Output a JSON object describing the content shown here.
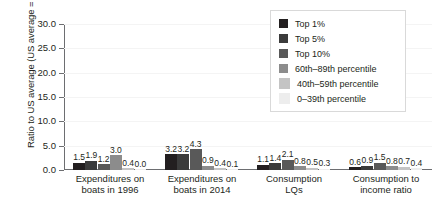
{
  "chart_data": {
    "type": "bar",
    "title": "",
    "subtitle": "",
    "xlabel": "",
    "ylabel": "Ratio to US average (US average = 1.0)",
    "ylim": [
      0.0,
      30.0
    ],
    "ytick_labels": [
      "0.0",
      "5.0",
      "10.0",
      "15.0",
      "20.0",
      "25.0",
      "30.0"
    ],
    "ytick_values": [
      0.0,
      5.0,
      10.0,
      15.0,
      20.0,
      25.0,
      30.0
    ],
    "grid": true,
    "grid_axis": "y",
    "legend_position": "top-right",
    "categories": [
      "Expenditures on boats in 1996",
      "Expenditures on boats in 2014",
      "Consumption LQs",
      "Consumption to income ratio"
    ],
    "category_lines": [
      [
        "Expenditures on",
        "boats in 1996"
      ],
      [
        "Expenditures on",
        "boats in 2014"
      ],
      [
        "Consumption",
        "LQs"
      ],
      [
        "Consumption to",
        "income ratio"
      ]
    ],
    "series": [
      {
        "name": "Top 1%",
        "color": "#231f20",
        "values": [
          1.5,
          3.2,
          1.1,
          0.6
        ],
        "labels": [
          "1.5",
          "3.2",
          "1.1",
          "0.6"
        ]
      },
      {
        "name": "Top 5%",
        "color": "#3b3b3b",
        "values": [
          1.9,
          3.2,
          1.4,
          0.9
        ],
        "labels": [
          "1.9",
          "3.2",
          "1.4",
          "0.9"
        ]
      },
      {
        "name": "Top 10%",
        "color": "#595959",
        "values": [
          1.2,
          4.3,
          2.1,
          1.5
        ],
        "labels": [
          "1.2",
          "4.3",
          "2.1",
          "1.5"
        ]
      },
      {
        "name": "60th–89th percentile",
        "color": "#8c8c8c",
        "values": [
          3.0,
          0.9,
          0.8,
          0.8
        ],
        "labels": [
          "3.0",
          "0.9",
          "0.8",
          "0.8"
        ]
      },
      {
        "name": "40th–59th percentile",
        "color": "#c4c4c4",
        "values": [
          0.4,
          0.4,
          0.5,
          0.7
        ],
        "labels": [
          "0.4",
          "0.4",
          "0.5",
          "0.7"
        ]
      },
      {
        "name": "0–39th percentile",
        "color": "#ededed",
        "values": [
          0.0,
          0.1,
          0.3,
          0.4
        ],
        "labels": [
          "0.0",
          "0.1",
          "0.3",
          "0.4"
        ]
      }
    ]
  },
  "legend": {
    "items": [
      {
        "label": "Top 1%",
        "color": "#231f20"
      },
      {
        "label": "Top 5%",
        "color": "#3b3b3b"
      },
      {
        "label": "Top 10%",
        "color": "#595959"
      },
      {
        "label": "60th–89th percentile",
        "color": "#8c8c8c"
      },
      {
        "label": "40th–59th percentile",
        "color": "#c4c4c4"
      },
      {
        "label": "0–39th percentile",
        "color": "#ededed"
      }
    ]
  },
  "colors": {
    "axis": "#6d6e71",
    "grid": "#f4f4f4",
    "text": "#231f20",
    "legend_border": "#d9d9d9",
    "background": "#ffffff"
  }
}
